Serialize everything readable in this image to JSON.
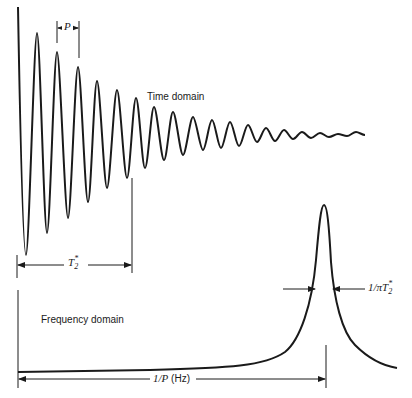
{
  "figure": {
    "time_domain": {
      "label": "Time domain",
      "period_label": "P",
      "decay_label": {
        "base": "T",
        "sup": "*",
        "sub": "2"
      }
    },
    "frequency_domain": {
      "label": "Frequency domain",
      "linewidth_label": {
        "prefix": "1/",
        "pi": "π",
        "base": "T",
        "sup": "*",
        "sub": "2"
      },
      "position_label": {
        "prefix": "1/",
        "var": "P",
        "unit": " (Hz)"
      }
    },
    "colors": {
      "ink": "#1a1a1a",
      "background": "#ffffff"
    }
  }
}
